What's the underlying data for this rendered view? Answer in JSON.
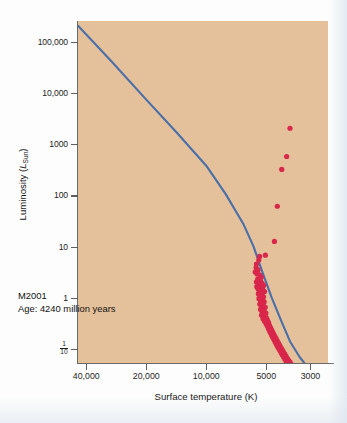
{
  "figure": {
    "background_color": "#e5c19b",
    "line_color": "#4a6fa8",
    "point_color": "#d9264b",
    "axis_color": "#5d5d5d"
  },
  "annotation": {
    "cluster_name": "M2001",
    "age_text": "Age: 4240 million years"
  },
  "chart_data": {
    "type": "scatter",
    "title": "",
    "xlabel": "Surface temperature (K)",
    "ylabel": "Luminosity (L_Sun)",
    "ylabel_main": "Luminosity (",
    "ylabel_symbol": "L",
    "ylabel_sub": "Sun",
    "ylabel_close": ")",
    "x_scale": "log-reversed",
    "y_scale": "log",
    "xlim": [
      44000,
      2450
    ],
    "ylim": [
      0.055,
      260000
    ],
    "grid": false,
    "legend": "none",
    "x_ticks": [
      40000,
      20000,
      10000,
      5000,
      3000
    ],
    "x_tick_labels": [
      "40,000",
      "20,000",
      "10,000",
      "5000",
      "3000"
    ],
    "y_ticks": [
      100000,
      10000,
      1000,
      100,
      10,
      1,
      0.1
    ],
    "y_tick_labels": [
      "100,000",
      "10,000",
      "1000",
      "100",
      "10",
      "1",
      "1/10"
    ],
    "series": [
      {
        "name": "zero-age main sequence",
        "type": "line",
        "color": "#4a6fa8",
        "points": [
          [
            44000,
            210000
          ],
          [
            30000,
            43000
          ],
          [
            20000,
            7600
          ],
          [
            14000,
            1700
          ],
          [
            10000,
            390
          ],
          [
            8000,
            110
          ],
          [
            6500,
            28
          ],
          [
            5800,
            10.5
          ],
          [
            5200,
            3.1
          ],
          [
            4700,
            1.05
          ],
          [
            4200,
            0.36
          ],
          [
            3800,
            0.145
          ],
          [
            3400,
            0.072
          ],
          [
            3050,
            0.042
          ]
        ]
      },
      {
        "name": "cluster stars",
        "type": "scatter",
        "color": "#d9264b",
        "marker": "circle",
        "marker_size": 2.6,
        "count": 150,
        "points": [
          [
            3800,
            2100
          ],
          [
            3950,
            590
          ],
          [
            4180,
            330
          ],
          [
            4400,
            63
          ],
          [
            4550,
            13
          ],
          [
            5050,
            7.0
          ],
          [
            5400,
            6.6
          ],
          [
            5450,
            5.6
          ],
          [
            5600,
            4.7
          ],
          [
            5620,
            4.0
          ],
          [
            5500,
            3.6
          ],
          [
            5680,
            3.3
          ],
          [
            5560,
            3.0
          ],
          [
            5400,
            2.9
          ],
          [
            5300,
            2.6
          ],
          [
            5520,
            2.4
          ],
          [
            5350,
            2.2
          ],
          [
            5600,
            2.1
          ],
          [
            5250,
            2.0
          ],
          [
            5450,
            1.85
          ],
          [
            5150,
            1.8
          ],
          [
            5580,
            1.7
          ],
          [
            5300,
            1.62
          ],
          [
            5500,
            1.55
          ],
          [
            5200,
            1.48
          ],
          [
            5420,
            1.42
          ],
          [
            5100,
            1.36
          ],
          [
            5350,
            1.3
          ],
          [
            5480,
            1.24
          ],
          [
            5250,
            1.18
          ],
          [
            5380,
            1.13
          ],
          [
            5160,
            1.08
          ],
          [
            5300,
            1.03
          ],
          [
            5440,
            0.99
          ],
          [
            5210,
            0.94
          ],
          [
            5340,
            0.9
          ],
          [
            5120,
            0.86
          ],
          [
            5270,
            0.82
          ],
          [
            5390,
            0.78
          ],
          [
            5180,
            0.74
          ],
          [
            5300,
            0.71
          ],
          [
            5060,
            0.67
          ],
          [
            5220,
            0.64
          ],
          [
            5340,
            0.61
          ],
          [
            5130,
            0.58
          ],
          [
            5250,
            0.55
          ],
          [
            5020,
            0.52
          ],
          [
            5160,
            0.5
          ],
          [
            5280,
            0.47
          ],
          [
            5080,
            0.45
          ],
          [
            4990,
            0.42
          ],
          [
            5190,
            0.4
          ],
          [
            4930,
            0.38
          ],
          [
            5100,
            0.36
          ],
          [
            4870,
            0.34
          ],
          [
            5010,
            0.32
          ],
          [
            4820,
            0.3
          ],
          [
            4940,
            0.29
          ],
          [
            4760,
            0.27
          ],
          [
            4880,
            0.26
          ],
          [
            4700,
            0.245
          ],
          [
            4810,
            0.23
          ],
          [
            4640,
            0.22
          ],
          [
            4750,
            0.21
          ],
          [
            4580,
            0.2
          ],
          [
            4690,
            0.19
          ],
          [
            4520,
            0.18
          ],
          [
            4630,
            0.172
          ],
          [
            4460,
            0.164
          ],
          [
            4570,
            0.156
          ],
          [
            4400,
            0.148
          ],
          [
            4510,
            0.141
          ],
          [
            4340,
            0.134
          ],
          [
            4450,
            0.128
          ],
          [
            4280,
            0.122
          ],
          [
            4390,
            0.116
          ],
          [
            4220,
            0.11
          ],
          [
            4330,
            0.105
          ],
          [
            4160,
            0.1
          ],
          [
            4270,
            0.096
          ],
          [
            4100,
            0.091
          ],
          [
            4210,
            0.087
          ],
          [
            4040,
            0.083
          ],
          [
            4150,
            0.079
          ],
          [
            3980,
            0.075
          ],
          [
            4090,
            0.072
          ],
          [
            3920,
            0.068
          ],
          [
            4030,
            0.065
          ],
          [
            3860,
            0.062
          ],
          [
            3970,
            0.059
          ],
          [
            3800,
            0.057
          ],
          [
            3910,
            0.054
          ],
          [
            3740,
            0.052
          ],
          [
            3850,
            0.05
          ],
          [
            3680,
            0.048
          ],
          [
            3790,
            0.046
          ],
          [
            3620,
            0.044
          ],
          [
            3730,
            0.042
          ],
          [
            3560,
            0.04
          ],
          [
            3670,
            0.039
          ],
          [
            3500,
            0.037
          ],
          [
            3610,
            0.036
          ],
          [
            3440,
            0.034
          ],
          [
            3550,
            0.033
          ],
          [
            3380,
            0.032
          ],
          [
            3490,
            0.031
          ],
          [
            3320,
            0.03
          ],
          [
            3430,
            0.029
          ],
          [
            3260,
            0.028
          ],
          [
            3370,
            0.027
          ],
          [
            3200,
            0.026
          ],
          [
            3310,
            0.025
          ],
          [
            3140,
            0.024
          ],
          [
            3250,
            0.0235
          ],
          [
            3080,
            0.0228
          ],
          [
            3190,
            0.0222
          ],
          [
            3020,
            0.0215
          ],
          [
            3130,
            0.0209
          ]
        ]
      }
    ]
  }
}
